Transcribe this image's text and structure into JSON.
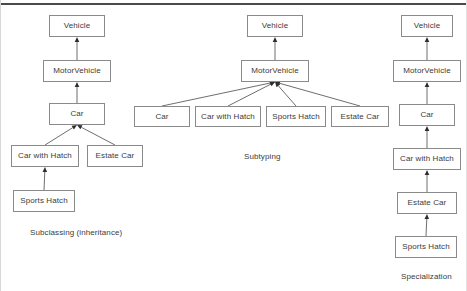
{
  "figure": {
    "top_rule": true,
    "background": "#ffffff",
    "box_border_color": "#8a8a8a",
    "edge_color": "#5e5e5e",
    "arrowhead_color": "#2e2e2e",
    "text_color": "#3b3b3b"
  },
  "diagrams": [
    {
      "id": "subclassing",
      "caption": "Subclassing (inheritance)",
      "caption_pos": {
        "x": 29,
        "y": 228
      },
      "nodes": [
        {
          "id": "l-vehicle",
          "label": "Vehicle",
          "x": 48,
          "y": 15,
          "w": 56,
          "h": 22
        },
        {
          "id": "l-motorvehicle",
          "label": "MotorVehicle",
          "x": 42,
          "y": 60,
          "w": 68,
          "h": 22
        },
        {
          "id": "l-car",
          "label": "Car",
          "x": 48,
          "y": 103,
          "w": 56,
          "h": 22
        },
        {
          "id": "l-carwithhatch",
          "label": "Car with Hatch",
          "x": 10,
          "y": 145,
          "w": 68,
          "h": 22
        },
        {
          "id": "l-estatecar",
          "label": "Estate Car",
          "x": 86,
          "y": 145,
          "w": 56,
          "h": 22
        },
        {
          "id": "l-sportshatch",
          "label": "Sports Hatch",
          "x": 12,
          "y": 190,
          "w": 62,
          "h": 22
        }
      ],
      "edges": [
        {
          "from": "l-motorvehicle",
          "to": "l-vehicle"
        },
        {
          "from": "l-car",
          "to": "l-motorvehicle"
        },
        {
          "from": "l-carwithhatch",
          "to": "l-car"
        },
        {
          "from": "l-estatecar",
          "to": "l-car"
        },
        {
          "from": "l-sportshatch",
          "to": "l-carwithhatch"
        }
      ]
    },
    {
      "id": "subtyping",
      "caption": "Subtyping",
      "caption_pos": {
        "x": 243,
        "y": 152
      },
      "nodes": [
        {
          "id": "m-vehicle",
          "label": "Vehicle",
          "x": 246,
          "y": 15,
          "w": 56,
          "h": 22
        },
        {
          "id": "m-motorvehicle",
          "label": "MotorVehicle",
          "x": 240,
          "y": 60,
          "w": 68,
          "h": 22
        },
        {
          "id": "m-car",
          "label": "Car",
          "x": 133,
          "y": 106,
          "w": 56,
          "h": 21
        },
        {
          "id": "m-carwithhatch",
          "label": "Car with Hatch",
          "x": 194,
          "y": 106,
          "w": 66,
          "h": 21
        },
        {
          "id": "m-sportshatch",
          "label": "Sports Hatch",
          "x": 265,
          "y": 106,
          "w": 60,
          "h": 21
        },
        {
          "id": "m-estatecar",
          "label": "Estate Car",
          "x": 330,
          "y": 106,
          "w": 58,
          "h": 21
        }
      ],
      "edges": [
        {
          "from": "m-motorvehicle",
          "to": "m-vehicle"
        },
        {
          "from": "m-car",
          "to": "m-motorvehicle"
        },
        {
          "from": "m-carwithhatch",
          "to": "m-motorvehicle"
        },
        {
          "from": "m-sportshatch",
          "to": "m-motorvehicle"
        },
        {
          "from": "m-estatecar",
          "to": "m-motorvehicle"
        }
      ]
    },
    {
      "id": "specialization",
      "caption": "Specialization",
      "caption_pos": {
        "x": 400,
        "y": 272
      },
      "nodes": [
        {
          "id": "r-vehicle",
          "label": "Vehicle",
          "x": 400,
          "y": 15,
          "w": 52,
          "h": 22
        },
        {
          "id": "r-motorvehicle",
          "label": "MotorVehicle",
          "x": 392,
          "y": 60,
          "w": 68,
          "h": 22
        },
        {
          "id": "r-car",
          "label": "Car",
          "x": 398,
          "y": 104,
          "w": 56,
          "h": 22
        },
        {
          "id": "r-carwithhatch",
          "label": "Car with Hatch",
          "x": 392,
          "y": 148,
          "w": 68,
          "h": 22
        },
        {
          "id": "r-estatecar",
          "label": "Estate Car",
          "x": 396,
          "y": 192,
          "w": 60,
          "h": 22
        },
        {
          "id": "r-sportshatch",
          "label": "Sports Hatch",
          "x": 394,
          "y": 236,
          "w": 62,
          "h": 22
        }
      ],
      "edges": [
        {
          "from": "r-motorvehicle",
          "to": "r-vehicle"
        },
        {
          "from": "r-car",
          "to": "r-motorvehicle"
        },
        {
          "from": "r-carwithhatch",
          "to": "r-car"
        },
        {
          "from": "r-estatecar",
          "to": "r-carwithhatch"
        },
        {
          "from": "r-sportshatch",
          "to": "r-estatecar"
        }
      ]
    }
  ]
}
